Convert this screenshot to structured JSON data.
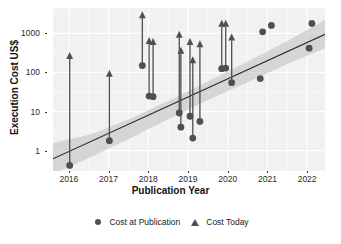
{
  "chart_data": {
    "type": "scatter",
    "title": "",
    "xlabel": "Publication Year",
    "ylabel": "Execution Cost US$",
    "xlim": [
      2015.6,
      2022.45
    ],
    "ylim_log10": [
      -0.52,
      3.65
    ],
    "yscale": "log10",
    "xticks": [
      2016,
      2017,
      2018,
      2019,
      2020,
      2021,
      2022
    ],
    "xticklabels": [
      "2016",
      "2017",
      "2018",
      "2019",
      "2020",
      "2021",
      "2022"
    ],
    "yticks": [
      1,
      10,
      100,
      1000
    ],
    "yticklabels": [
      "1",
      "10",
      "100",
      "1000"
    ],
    "grid": true,
    "grid_color": "#ffffff",
    "panel_color": "#f1f1f1",
    "legend_position": "bottom",
    "legend": [
      {
        "name": "Cost at Publication",
        "marker": "circle",
        "color": "#4f4f4f"
      },
      {
        "name": "Cost Today",
        "marker": "triangle",
        "color": "#4f4f4f"
      }
    ],
    "series": [
      {
        "name": "Cost at Publication",
        "marker": "circle",
        "color": "#4f4f4f",
        "points": [
          {
            "x": 2016.02,
            "y": 0.42
          },
          {
            "x": 2017.02,
            "y": 1.8
          },
          {
            "x": 2017.85,
            "y": 150
          },
          {
            "x": 2018.02,
            "y": 25
          },
          {
            "x": 2018.12,
            "y": 24
          },
          {
            "x": 2018.78,
            "y": 9.2
          },
          {
            "x": 2018.82,
            "y": 4.0
          },
          {
            "x": 2019.05,
            "y": 7.6
          },
          {
            "x": 2019.12,
            "y": 2.1
          },
          {
            "x": 2019.3,
            "y": 5.6
          },
          {
            "x": 2019.85,
            "y": 125
          },
          {
            "x": 2019.95,
            "y": 130
          },
          {
            "x": 2020.1,
            "y": 55
          },
          {
            "x": 2020.82,
            "y": 70
          },
          {
            "x": 2020.88,
            "y": 1100
          },
          {
            "x": 2021.1,
            "y": 1600
          },
          {
            "x": 2022.05,
            "y": 420
          },
          {
            "x": 2022.12,
            "y": 1800
          }
        ]
      },
      {
        "name": "Cost Today",
        "marker": "triangle",
        "color": "#4f4f4f",
        "points": [
          {
            "x": 2016.02,
            "y": 270
          },
          {
            "x": 2017.02,
            "y": 95
          },
          {
            "x": 2017.85,
            "y": 3000
          },
          {
            "x": 2018.02,
            "y": 650
          },
          {
            "x": 2018.12,
            "y": 620
          },
          {
            "x": 2018.78,
            "y": 950
          },
          {
            "x": 2018.82,
            "y": 370
          },
          {
            "x": 2019.05,
            "y": 620
          },
          {
            "x": 2019.12,
            "y": 210
          },
          {
            "x": 2019.3,
            "y": 540
          },
          {
            "x": 2019.85,
            "y": 1800
          },
          {
            "x": 2019.95,
            "y": 1800
          },
          {
            "x": 2020.1,
            "y": 800
          }
        ]
      }
    ],
    "arrows": [
      {
        "x": 2016.02,
        "y0": 0.42,
        "y1": 270
      },
      {
        "x": 2017.02,
        "y0": 1.8,
        "y1": 95
      },
      {
        "x": 2017.85,
        "y0": 150,
        "y1": 3000
      },
      {
        "x": 2018.02,
        "y0": 25,
        "y1": 650
      },
      {
        "x": 2018.12,
        "y0": 24,
        "y1": 620
      },
      {
        "x": 2018.78,
        "y0": 9.2,
        "y1": 950
      },
      {
        "x": 2018.82,
        "y0": 4.0,
        "y1": 370
      },
      {
        "x": 2019.05,
        "y0": 7.6,
        "y1": 620
      },
      {
        "x": 2019.12,
        "y0": 2.1,
        "y1": 210
      },
      {
        "x": 2019.3,
        "y0": 5.6,
        "y1": 540
      },
      {
        "x": 2019.85,
        "y0": 125,
        "y1": 1800
      },
      {
        "x": 2019.95,
        "y0": 130,
        "y1": 1800
      },
      {
        "x": 2020.1,
        "y0": 55,
        "y1": 800
      }
    ],
    "trend_line": {
      "color": "#2b2b2b",
      "points": [
        {
          "x": 2015.6,
          "y": 0.62
        },
        {
          "x": 2022.45,
          "y": 950
        }
      ]
    },
    "confidence_band": {
      "fill": "#c4c4c4",
      "upper": [
        {
          "x": 2015.6,
          "y": 1.55
        },
        {
          "x": 2016.6,
          "y": 2.7
        },
        {
          "x": 2017.6,
          "y": 7.0
        },
        {
          "x": 2018.6,
          "y": 21
        },
        {
          "x": 2019.6,
          "y": 66
        },
        {
          "x": 2020.6,
          "y": 215
        },
        {
          "x": 2021.5,
          "y": 640
        },
        {
          "x": 2022.45,
          "y": 2200
        }
      ],
      "lower": [
        {
          "x": 2015.6,
          "y": 0.25
        },
        {
          "x": 2016.6,
          "y": 0.72
        },
        {
          "x": 2017.6,
          "y": 2.2
        },
        {
          "x": 2018.6,
          "y": 7.2
        },
        {
          "x": 2019.6,
          "y": 22
        },
        {
          "x": 2020.6,
          "y": 62
        },
        {
          "x": 2021.5,
          "y": 165
        },
        {
          "x": 2022.45,
          "y": 420
        }
      ]
    }
  }
}
